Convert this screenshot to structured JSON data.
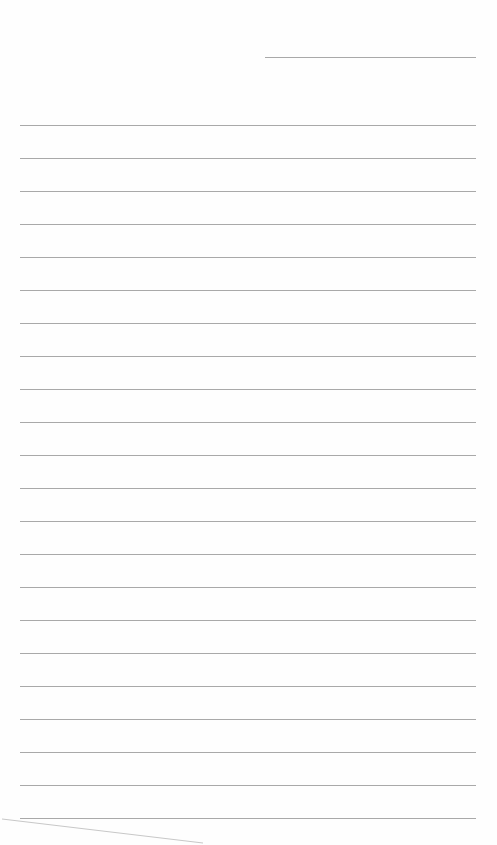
{
  "page": {
    "type": "blank ruled notebook page",
    "header_line": {
      "x1": 265,
      "x2": 476,
      "y": 57
    },
    "ruled_lines": {
      "count": 22,
      "start_y": 125,
      "spacing": 33,
      "x1": 20,
      "x2": 476,
      "color": "#9a9a9a"
    },
    "text_content": ""
  }
}
